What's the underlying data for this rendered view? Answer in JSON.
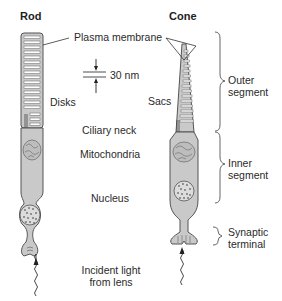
{
  "diagram": {
    "titles": {
      "rod": "Rod",
      "cone": "Cone"
    },
    "labels": {
      "plasma_membrane": "Plasma membrane",
      "scale": "30 nm",
      "disks": "Disks",
      "sacs": "Sacs",
      "ciliary_neck": "Ciliary neck",
      "mitochondria": "Mitochondria",
      "nucleus": "Nucleus",
      "incident_light_1": "Incident light",
      "incident_light_2": "from lens"
    },
    "segments": {
      "outer_1": "Outer",
      "outer_2": "segment",
      "inner_1": "Inner",
      "inner_2": "segment",
      "synaptic_1": "Synaptic",
      "synaptic_2": "terminal"
    },
    "colors": {
      "cell_fill": "#c9c9c9",
      "outline": "#555555",
      "disk_fill": "#ffffff",
      "text": "#2a2a2a"
    }
  }
}
